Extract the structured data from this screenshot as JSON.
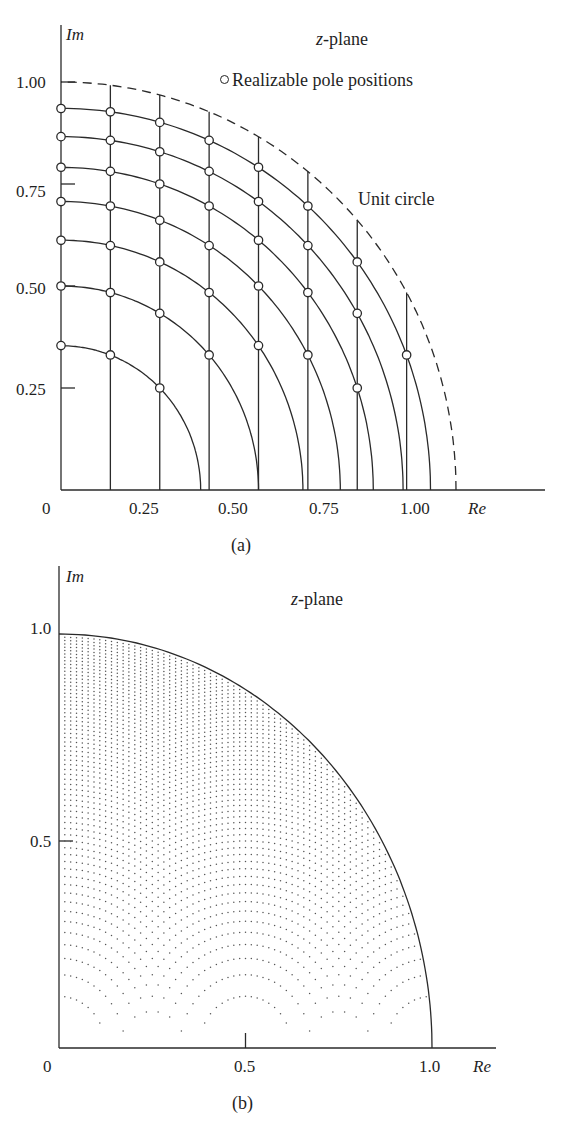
{
  "chart_data": [
    {
      "panel": "(a)",
      "type": "scatter",
      "title": "z-plane",
      "xlabel": "Re",
      "ylabel": "Im",
      "xlim": [
        0,
        1.0
      ],
      "ylim": [
        0,
        1.0
      ],
      "xticks": [
        "0",
        "0.25",
        "0.50",
        "0.75",
        "1.00"
      ],
      "yticks": [
        "0.25",
        "0.50",
        "0.75",
        "1.00"
      ],
      "grid": false,
      "legend": "Realizable pole positions",
      "annotation": "Unit circle",
      "description": "Coupled-form quantized pole grid: vertical lines at Re = j/8 and circular arcs at r^2 = k/8; poles at intersections",
      "vertical_lines_re": [
        0.125,
        0.25,
        0.375,
        0.5,
        0.625,
        0.75,
        0.875
      ],
      "arc_radii_squared": [
        0.125,
        0.25,
        0.375,
        0.5,
        0.625,
        0.75,
        0.875
      ],
      "arc_radii": [
        0.354,
        0.5,
        0.612,
        0.707,
        0.791,
        0.866,
        0.935
      ],
      "unit_circle_style": "dashed",
      "pole_points": [
        {
          "re": 0,
          "im": 0.354
        },
        {
          "re": 0,
          "im": 0.5
        },
        {
          "re": 0,
          "im": 0.612
        },
        {
          "re": 0,
          "im": 0.707
        },
        {
          "re": 0,
          "im": 0.791
        },
        {
          "re": 0,
          "im": 0.866
        },
        {
          "re": 0,
          "im": 0.935
        },
        {
          "re": 0.125,
          "im": 0.331
        },
        {
          "re": 0.125,
          "im": 0.484
        },
        {
          "re": 0.125,
          "im": 0.599
        },
        {
          "re": 0.125,
          "im": 0.696
        },
        {
          "re": 0.125,
          "im": 0.781
        },
        {
          "re": 0.125,
          "im": 0.857
        },
        {
          "re": 0.125,
          "im": 0.927
        },
        {
          "re": 0.25,
          "im": 0.25
        },
        {
          "re": 0.25,
          "im": 0.433
        },
        {
          "re": 0.25,
          "im": 0.559
        },
        {
          "re": 0.25,
          "im": 0.661
        },
        {
          "re": 0.25,
          "im": 0.75
        },
        {
          "re": 0.25,
          "im": 0.829
        },
        {
          "re": 0.25,
          "im": 0.901
        },
        {
          "re": 0.375,
          "im": 0.331
        },
        {
          "re": 0.375,
          "im": 0.484
        },
        {
          "re": 0.375,
          "im": 0.599
        },
        {
          "re": 0.375,
          "im": 0.696
        },
        {
          "re": 0.375,
          "im": 0.781
        },
        {
          "re": 0.375,
          "im": 0.857
        },
        {
          "re": 0.5,
          "im": 0.354
        },
        {
          "re": 0.5,
          "im": 0.5
        },
        {
          "re": 0.5,
          "im": 0.612
        },
        {
          "re": 0.5,
          "im": 0.707
        },
        {
          "re": 0.5,
          "im": 0.791
        },
        {
          "re": 0.625,
          "im": 0.331
        },
        {
          "re": 0.625,
          "im": 0.484
        },
        {
          "re": 0.625,
          "im": 0.599
        },
        {
          "re": 0.625,
          "im": 0.696
        },
        {
          "re": 0.75,
          "im": 0.25
        },
        {
          "re": 0.75,
          "im": 0.433
        },
        {
          "re": 0.75,
          "im": 0.559
        },
        {
          "re": 0.875,
          "im": 0.331
        }
      ]
    },
    {
      "panel": "(b)",
      "type": "scatter",
      "title": "z-plane",
      "xlabel": "Re",
      "ylabel": "Im",
      "xlim": [
        0,
        1.0
      ],
      "ylim": [
        0,
        1.0
      ],
      "xticks": [
        "0",
        "0.5",
        "1.0"
      ],
      "yticks": [
        "0.5",
        "1.0"
      ],
      "grid": false,
      "description": "Direct-form quantized pole positions: Re = i/64, r^2 = m/64, Im = sqrt(r^2 - Re^2), inside unit circle",
      "re_step": 0.015625,
      "r_squared_step": 0.015625,
      "unit_circle_style": "solid"
    }
  ],
  "panel_a": {
    "ylabel": "Im",
    "xlabel": "Re",
    "title": "z-plane",
    "legend": "Realizable pole positions",
    "annotation": "Unit circle",
    "yticks": {
      "t100": "1.00",
      "t075": "0.75",
      "t050": "0.50",
      "t025": "0.25"
    },
    "xticks": {
      "t0": "0",
      "t025": "0.25",
      "t050": "0.50",
      "t075": "0.75",
      "t100": "1.00"
    },
    "caption": "(a)"
  },
  "panel_b": {
    "ylabel": "Im",
    "xlabel": "Re",
    "title": "z-plane",
    "yticks": {
      "t10": "1.0",
      "t05": "0.5"
    },
    "xticks": {
      "t0": "0",
      "t05": "0.5",
      "t10": "1.0"
    },
    "caption": "(b)"
  },
  "colors": {
    "ink": "#2a2a2a",
    "background": "#ffffff"
  }
}
